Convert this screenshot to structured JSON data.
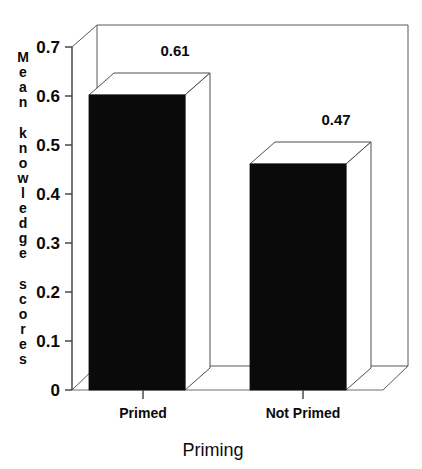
{
  "chart_data": {
    "type": "bar",
    "title": "",
    "subtitle": "",
    "categories": [
      "Primed",
      "Not Primed"
    ],
    "values": [
      0.61,
      0.47
    ],
    "value_labels": [
      "0.61",
      "0.47"
    ],
    "xlabel": "Priming",
    "ylabel": "Mean knowledge scores",
    "ylim": [
      0,
      0.7
    ],
    "ytick_values": [
      0,
      0.1,
      0.2,
      0.3,
      0.4,
      0.5,
      0.6,
      0.7
    ],
    "ytick_labels": [
      "0",
      "0.1",
      "0.2",
      "0.3",
      "0.4",
      "0.5",
      "0.6",
      "0.7"
    ],
    "grid": false,
    "legend": false,
    "legend_position": "none",
    "style": "3d-bar",
    "bar_color": "#0a0a0a",
    "bar_top_color": "#ffffff",
    "frame_color": "#555a5e",
    "background": "#ffffff",
    "series": [
      {
        "name": "Mean knowledge scores",
        "values": [
          0.61,
          0.47
        ]
      }
    ]
  },
  "axis": {
    "y_label_letters": [
      "M",
      "e",
      "a",
      "n",
      "",
      "k",
      "n",
      "o",
      "w",
      "l",
      "e",
      "d",
      "g",
      "e",
      "",
      "s",
      "c",
      "o",
      "r",
      "e",
      "s"
    ],
    "x_title": "Priming"
  }
}
